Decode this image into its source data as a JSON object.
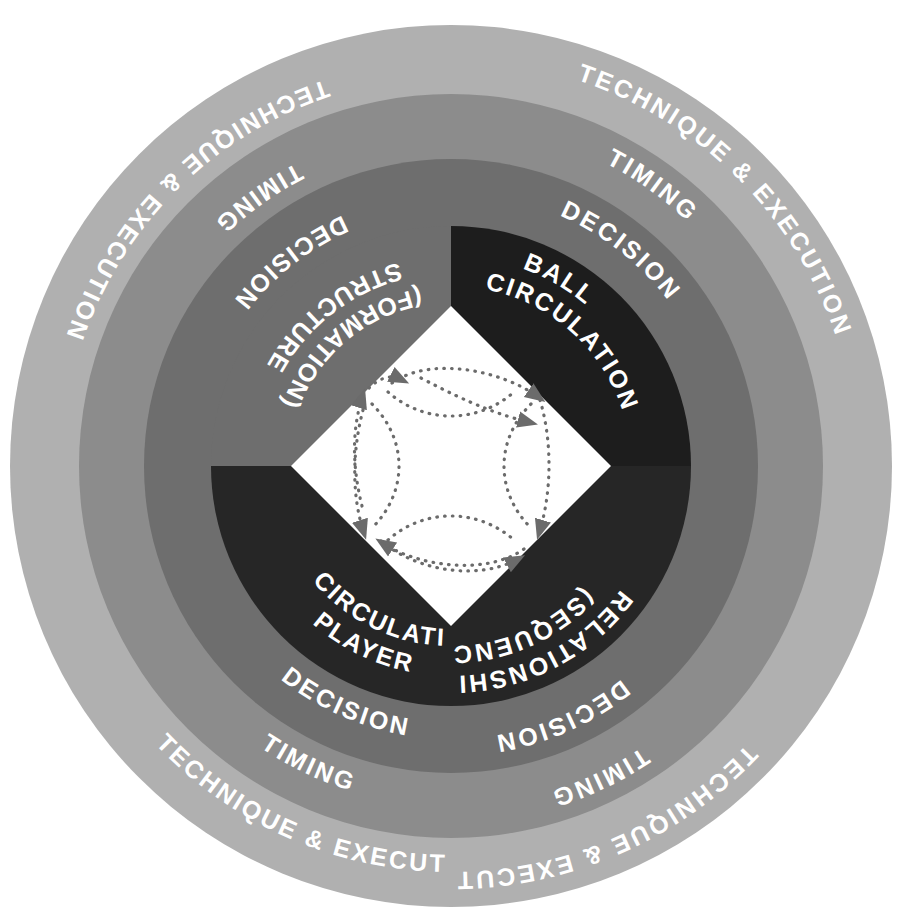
{
  "diagram": {
    "shape": "concentric-rings-with-quadrant-core",
    "center": {
      "x": 451,
      "y": 466
    },
    "outer_radius": 441,
    "background_color": "#ffffff",
    "rings": [
      {
        "id": "technique-execution",
        "label": "TECHNIQUE & EXECUTION",
        "level": 1,
        "position": "outermost",
        "color": "#b0b0b0",
        "text_color": "#ffffff",
        "outer_radius": 441,
        "inner_radius": 372,
        "repeats": 2
      },
      {
        "id": "timing",
        "label": "TIMING",
        "level": 2,
        "position": "second",
        "color": "#8c8c8c",
        "text_color": "#ffffff",
        "outer_radius": 372,
        "inner_radius": 307,
        "repeats": 2
      },
      {
        "id": "decision",
        "label": "DECISION",
        "level": 3,
        "position": "third",
        "color": "#6e6e6e",
        "text_color": "#ffffff",
        "outer_radius": 307,
        "inner_radius": 240,
        "repeats": 2
      }
    ],
    "core": {
      "id": "core-quadrants",
      "radius": 240,
      "quadrants": [
        {
          "id": "structure-formation",
          "line1": "STRUCTURE",
          "line2": "(FORMATION)",
          "position": "top-left",
          "color": "#6e6e6e",
          "text_color": "#ffffff"
        },
        {
          "id": "ball-circulation",
          "line1": "BALL",
          "line2": "CIRCULATION",
          "position": "top-right",
          "color": "#1d1d1d",
          "text_color": "#ffffff"
        },
        {
          "id": "relationship-sequencing",
          "line1": "RELATIONSHIP",
          "line2": "(SEQUENCING)",
          "position": "bottom-right",
          "color": "#262626",
          "text_color": "#ffffff"
        },
        {
          "id": "player-circulation",
          "line1": "PLAYER",
          "line2": "CIRCULATION",
          "position": "bottom-left",
          "color": "#262626",
          "text_color": "#ffffff"
        }
      ]
    },
    "center_diamond": {
      "id": "center-diamond",
      "shape": "diamond",
      "color": "#ffffff",
      "half_diagonal": 160,
      "contents": "dotted curved circulation arrows",
      "arrow_color": "#6b6b6b",
      "arrow_style": "dotted",
      "arrow_count": 8
    }
  }
}
